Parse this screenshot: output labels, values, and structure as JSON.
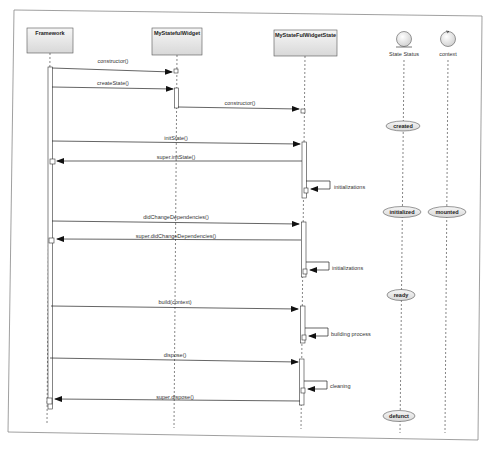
{
  "participants": [
    {
      "id": "framework",
      "label": "Framework",
      "type": "object",
      "x": 47
    },
    {
      "id": "widget",
      "label": "MyStatefulWidget",
      "type": "object",
      "x": 176
    },
    {
      "id": "state",
      "label": "MyStateFulWidgetState",
      "type": "object",
      "x": 305
    },
    {
      "id": "status",
      "label": "State Status",
      "type": "entity",
      "x": 403
    },
    {
      "id": "context",
      "label": "context",
      "type": "control",
      "x": 448
    }
  ],
  "messages": [
    {
      "label": "constructor()",
      "from": "framework",
      "to": "widget",
      "y": 69
    },
    {
      "label": "createState()",
      "from": "framework",
      "to": "widget",
      "y": 88
    },
    {
      "label": "constructor()",
      "from": "widget",
      "to": "state",
      "y": 108
    },
    {
      "label": "initState()",
      "from": "framework",
      "to": "state",
      "y": 143
    },
    {
      "label": "super.initState()",
      "from": "state",
      "to": "framework",
      "y": 161
    },
    {
      "label": "initializations",
      "from": "state",
      "to": "state",
      "y": 186,
      "self": true
    },
    {
      "label": "didChangeDependencies()",
      "from": "framework",
      "to": "state",
      "y": 222
    },
    {
      "label": "super.didChangeDependencies()",
      "from": "state",
      "to": "framework",
      "y": 240
    },
    {
      "label": "initializations",
      "from": "state",
      "to": "state",
      "y": 267,
      "self": true
    },
    {
      "label": "build(context)",
      "from": "framework",
      "to": "state",
      "y": 307
    },
    {
      "label": "building process",
      "from": "state",
      "to": "state",
      "y": 333,
      "self": true
    },
    {
      "label": "dispose()",
      "from": "framework",
      "to": "state",
      "y": 359
    },
    {
      "label": "cleaning",
      "from": "state",
      "to": "state",
      "y": 384,
      "self": true
    },
    {
      "label": "super.dispose()",
      "from": "state",
      "to": "framework",
      "y": 400
    }
  ],
  "states": [
    {
      "label": "created",
      "lifeline": "status",
      "y": 126
    },
    {
      "label": "initialized",
      "lifeline": "status",
      "y": 211
    },
    {
      "label": "mounted",
      "lifeline": "context",
      "y": 211
    },
    {
      "label": "ready",
      "lifeline": "status",
      "y": 295
    },
    {
      "label": "defunct",
      "lifeline": "status",
      "y": 415
    }
  ],
  "colors": {
    "line": "#333333",
    "box_fill_top": "#f4f4f4",
    "box_fill_bottom": "#d9d9d9",
    "frame": "#888888"
  }
}
